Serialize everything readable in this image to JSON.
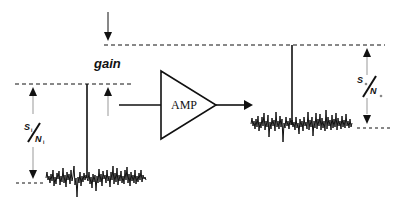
{
  "diagram": {
    "gain_label": "gain",
    "amp_label": "AMP",
    "input_ratio": {
      "s": "S",
      "s_sub": "i",
      "n": "N",
      "n_sub": "i"
    },
    "output_ratio": {
      "s": "S",
      "s_sub": "o",
      "n": "N",
      "n_sub": "o"
    },
    "colors": {
      "ink": "#111111",
      "arrow_gray": "#888888"
    }
  }
}
